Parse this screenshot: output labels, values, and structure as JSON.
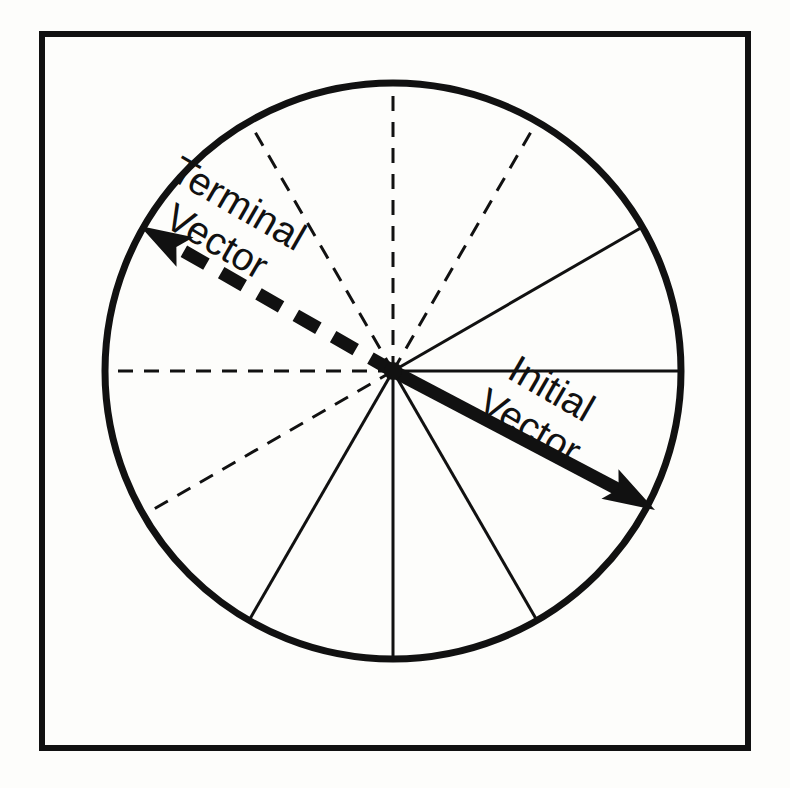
{
  "figure": {
    "background_color": "#fdfdfb",
    "ink_color": "#111111"
  },
  "frame": {
    "name": "outer-border",
    "x": 42,
    "y": 34,
    "width": 706,
    "height": 714,
    "stroke_width": 6,
    "color": "#111111"
  },
  "circle": {
    "name": "clock-circle",
    "center_x": 393,
    "center_y": 371,
    "radius": 288,
    "stroke_width": 7,
    "color": "#111111"
  },
  "hub": {
    "name": "center-hub",
    "x": 393,
    "y": 371,
    "radius": 9
  },
  "spokes": [
    {
      "label": "0-degrees",
      "angle_deg": 0,
      "style": "solid",
      "stroke_width": 3
    },
    {
      "label": "30-degrees",
      "angle_deg": 30,
      "style": "solid",
      "stroke_width": 3
    },
    {
      "label": "60-degrees",
      "angle_deg": 60,
      "style": "dashed",
      "stroke_width": 3
    },
    {
      "label": "90-degrees",
      "angle_deg": 90,
      "style": "dashed",
      "stroke_width": 3
    },
    {
      "label": "120-degrees",
      "angle_deg": 120,
      "style": "dashed",
      "stroke_width": 3
    },
    {
      "label": "150-degrees",
      "angle_deg": 150,
      "style": "hidden",
      "stroke_width": 3
    },
    {
      "label": "180-degrees",
      "angle_deg": 180,
      "style": "dashed",
      "stroke_width": 3
    },
    {
      "label": "210-degrees",
      "angle_deg": 210,
      "style": "dashed",
      "stroke_width": 3
    },
    {
      "label": "240-degrees",
      "angle_deg": 240,
      "style": "solid",
      "stroke_width": 3
    },
    {
      "label": "270-degrees",
      "angle_deg": 270,
      "style": "solid",
      "stroke_width": 3
    },
    {
      "label": "300-degrees",
      "angle_deg": 300,
      "style": "solid",
      "stroke_width": 3
    },
    {
      "label": "330-degrees",
      "angle_deg": 330,
      "style": "hidden",
      "stroke_width": 3
    }
  ],
  "vectors": [
    {
      "id": "initial-vector",
      "text_line1": "Initial",
      "text_line2": "Vector",
      "angle_deg": -30,
      "style": "solid",
      "stroke_width": 13,
      "tip_x": 655,
      "tip_y": 510,
      "label_x": 545,
      "label_y": 400,
      "label_rotation_deg": 30,
      "font_size": 39
    },
    {
      "id": "terminal-vector",
      "text_line1": "Terminal",
      "text_line2": "Vector",
      "angle_deg": 150,
      "style": "dashed",
      "stroke_width": 13,
      "dash_pattern": "26 17",
      "tip_x": 140,
      "tip_y": 226,
      "label_x": 232,
      "label_y": 215,
      "label_rotation_deg": 30,
      "font_size": 39
    }
  ]
}
